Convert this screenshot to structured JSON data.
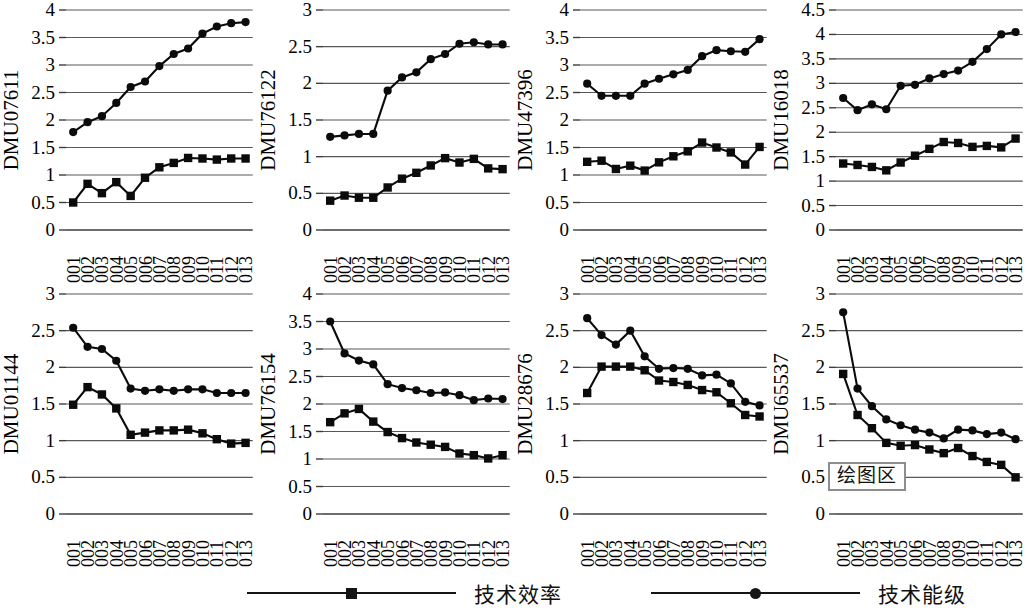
{
  "legend": {
    "items": [
      {
        "label": "技术效率",
        "marker": "square-marker-icon",
        "color": "#141414"
      },
      {
        "label": "技术能级",
        "marker": "circle-marker-icon",
        "color": "#141414"
      }
    ]
  },
  "annotation": {
    "plot_area_label": "绘图区"
  },
  "years": [
    "2001",
    "2002",
    "2003",
    "2004",
    "2005",
    "2006",
    "2007",
    "2008",
    "2009",
    "2010",
    "2011",
    "2012",
    "2013"
  ],
  "chart_data": [
    {
      "type": "line",
      "title": "DMU07611",
      "ylabel": "DMU07611",
      "xlabel": "",
      "x": [
        "2001",
        "2002",
        "2003",
        "2004",
        "2005",
        "2006",
        "2007",
        "2008",
        "2009",
        "2010",
        "2011",
        "2012",
        "2013"
      ],
      "ylim": [
        0,
        4
      ],
      "yticks": [
        "0",
        "0.5",
        "1",
        "1.5",
        "2",
        "2.5",
        "3",
        "3.5",
        "4"
      ],
      "grid": true,
      "series": [
        {
          "name": "技术效率",
          "marker": "square",
          "values": [
            0.5,
            0.84,
            0.67,
            0.87,
            0.62,
            0.95,
            1.14,
            1.22,
            1.31,
            1.3,
            1.28,
            1.3,
            1.3
          ]
        },
        {
          "name": "技术能级",
          "marker": "circle",
          "values": [
            1.78,
            1.96,
            2.07,
            2.31,
            2.6,
            2.7,
            2.98,
            3.2,
            3.3,
            3.57,
            3.7,
            3.76,
            3.78
          ]
        }
      ]
    },
    {
      "type": "line",
      "title": "DMU76122",
      "ylabel": "DMU76122",
      "xlabel": "",
      "x": [
        "2001",
        "2002",
        "2003",
        "2004",
        "2005",
        "2006",
        "2007",
        "2008",
        "2009",
        "2010",
        "2011",
        "2012",
        "2013"
      ],
      "ylim": [
        0,
        3
      ],
      "yticks": [
        "0",
        "0.5",
        "1",
        "1.5",
        "2",
        "2.5",
        "3"
      ],
      "grid": true,
      "series": [
        {
          "name": "技术效率",
          "marker": "square",
          "values": [
            0.4,
            0.47,
            0.44,
            0.44,
            0.58,
            0.7,
            0.78,
            0.88,
            0.98,
            0.92,
            0.97,
            0.84,
            0.83
          ]
        },
        {
          "name": "技术能级",
          "marker": "circle",
          "values": [
            1.27,
            1.29,
            1.31,
            1.31,
            1.9,
            2.08,
            2.15,
            2.33,
            2.4,
            2.54,
            2.56,
            2.53,
            2.53
          ]
        }
      ]
    },
    {
      "type": "line",
      "title": "DMU47396",
      "ylabel": "DMU47396",
      "xlabel": "",
      "x": [
        "2001",
        "2002",
        "2003",
        "2004",
        "2005",
        "2006",
        "2007",
        "2008",
        "2009",
        "2010",
        "2011",
        "2012",
        "2013"
      ],
      "ylim": [
        0,
        4
      ],
      "yticks": [
        "0",
        "0.5",
        "1",
        "1.5",
        "2",
        "2.5",
        "3",
        "3.5",
        "4"
      ],
      "grid": true,
      "series": [
        {
          "name": "技术效率",
          "marker": "square",
          "values": [
            1.24,
            1.26,
            1.11,
            1.17,
            1.08,
            1.23,
            1.34,
            1.43,
            1.59,
            1.5,
            1.41,
            1.19,
            1.51
          ]
        },
        {
          "name": "技术能级",
          "marker": "circle",
          "values": [
            2.66,
            2.44,
            2.44,
            2.44,
            2.66,
            2.75,
            2.83,
            2.91,
            3.16,
            3.27,
            3.25,
            3.24,
            3.47
          ]
        }
      ]
    },
    {
      "type": "line",
      "title": "DMU16018",
      "ylabel": "DMU16018",
      "xlabel": "",
      "x": [
        "2001",
        "2002",
        "2003",
        "2004",
        "2005",
        "2006",
        "2007",
        "2008",
        "2009",
        "2010",
        "2011",
        "2012",
        "2013"
      ],
      "ylim": [
        0,
        4.5
      ],
      "yticks": [
        "0",
        "0.5",
        "1",
        "1.5",
        "2",
        "2.5",
        "3",
        "3.5",
        "4",
        "4.5"
      ],
      "grid": true,
      "series": [
        {
          "name": "技术效率",
          "marker": "square",
          "values": [
            1.36,
            1.33,
            1.29,
            1.22,
            1.38,
            1.52,
            1.66,
            1.8,
            1.78,
            1.7,
            1.72,
            1.69,
            1.87
          ]
        },
        {
          "name": "技术能级",
          "marker": "circle",
          "values": [
            2.7,
            2.45,
            2.57,
            2.47,
            2.95,
            2.97,
            3.1,
            3.19,
            3.26,
            3.44,
            3.7,
            4.0,
            4.05
          ]
        }
      ]
    },
    {
      "type": "line",
      "title": "DMU01144",
      "ylabel": "DMU01144",
      "xlabel": "",
      "x": [
        "2001",
        "2002",
        "2003",
        "2004",
        "2005",
        "2006",
        "2007",
        "2008",
        "2009",
        "2010",
        "2011",
        "2012",
        "2013"
      ],
      "ylim": [
        0,
        3
      ],
      "yticks": [
        "0",
        "0.5",
        "1",
        "1.5",
        "2",
        "2.5",
        "3"
      ],
      "grid": true,
      "series": [
        {
          "name": "技术效率",
          "marker": "square",
          "values": [
            1.49,
            1.73,
            1.63,
            1.44,
            1.08,
            1.11,
            1.14,
            1.14,
            1.15,
            1.1,
            1.02,
            0.96,
            0.97
          ]
        },
        {
          "name": "技术能级",
          "marker": "circle",
          "values": [
            2.54,
            2.28,
            2.25,
            2.09,
            1.71,
            1.68,
            1.7,
            1.68,
            1.7,
            1.7,
            1.65,
            1.65,
            1.65
          ]
        }
      ]
    },
    {
      "type": "line",
      "title": "DMU76154",
      "ylabel": "DMU76154",
      "xlabel": "",
      "x": [
        "2001",
        "2002",
        "2003",
        "2004",
        "2005",
        "2006",
        "2007",
        "2008",
        "2009",
        "2010",
        "2011",
        "2012",
        "2013"
      ],
      "ylim": [
        0,
        4
      ],
      "yticks": [
        "0",
        "0.5",
        "1",
        "1.5",
        "2",
        "2.5",
        "3",
        "3.5",
        "4"
      ],
      "grid": true,
      "series": [
        {
          "name": "技术效率",
          "marker": "square",
          "values": [
            1.67,
            1.83,
            1.91,
            1.68,
            1.49,
            1.38,
            1.3,
            1.26,
            1.22,
            1.1,
            1.07,
            1.01,
            1.07
          ]
        },
        {
          "name": "技术能级",
          "marker": "circle",
          "values": [
            3.5,
            2.92,
            2.79,
            2.72,
            2.36,
            2.29,
            2.25,
            2.2,
            2.21,
            2.16,
            2.07,
            2.1,
            2.09
          ]
        }
      ]
    },
    {
      "type": "line",
      "title": "DMU28676",
      "ylabel": "DMU28676",
      "xlabel": "",
      "x": [
        "2001",
        "2002",
        "2003",
        "2004",
        "2005",
        "2006",
        "2007",
        "2008",
        "2009",
        "2010",
        "2011",
        "2012",
        "2013"
      ],
      "ylim": [
        0,
        3
      ],
      "yticks": [
        "0",
        "0.5",
        "1",
        "1.5",
        "2",
        "2.5",
        "3"
      ],
      "grid": true,
      "series": [
        {
          "name": "技术效率",
          "marker": "square",
          "values": [
            1.65,
            2.01,
            2.01,
            2.01,
            1.96,
            1.82,
            1.8,
            1.76,
            1.69,
            1.66,
            1.51,
            1.35,
            1.33
          ]
        },
        {
          "name": "技术能级",
          "marker": "circle",
          "values": [
            2.67,
            2.44,
            2.31,
            2.5,
            2.15,
            1.98,
            1.99,
            1.98,
            1.89,
            1.9,
            1.78,
            1.53,
            1.48
          ]
        }
      ]
    },
    {
      "type": "line",
      "title": "DMU65537",
      "ylabel": "DMU65537",
      "xlabel": "",
      "x": [
        "2001",
        "2002",
        "2003",
        "2004",
        "2005",
        "2006",
        "2007",
        "2008",
        "2009",
        "2010",
        "2011",
        "2012",
        "2013"
      ],
      "ylim": [
        0,
        3
      ],
      "yticks": [
        "0",
        "0.5",
        "1",
        "1.5",
        "2",
        "2.5",
        "3"
      ],
      "grid": true,
      "series": [
        {
          "name": "技术效率",
          "marker": "square",
          "values": [
            1.91,
            1.35,
            1.17,
            0.97,
            0.93,
            0.94,
            0.88,
            0.83,
            0.9,
            0.79,
            0.71,
            0.67,
            0.5
          ]
        },
        {
          "name": "技术能级",
          "marker": "circle",
          "values": [
            2.75,
            1.71,
            1.47,
            1.29,
            1.21,
            1.15,
            1.11,
            1.03,
            1.15,
            1.14,
            1.09,
            1.11,
            1.02
          ]
        }
      ]
    }
  ]
}
